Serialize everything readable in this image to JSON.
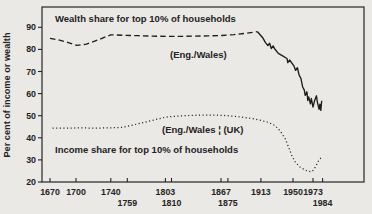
{
  "figure": {
    "background": "#ebe9e6",
    "ink": "#232323"
  },
  "chart_data": {
    "type": "line",
    "title": "",
    "xlabel": "",
    "ylabel": "Per cent of income or wealth",
    "ylim": [
      20,
      99
    ],
    "x_range_years": [
      1670,
      1984
    ],
    "grid": false,
    "legend_position": "inline-annotations",
    "y_ticks": [
      90,
      80,
      70,
      60,
      50,
      40,
      30,
      20
    ],
    "x_ticks": [
      {
        "label": "1670",
        "year": 1670,
        "row": 1
      },
      {
        "label": "1700",
        "year": 1700,
        "row": 1
      },
      {
        "label": "1740",
        "year": 1740,
        "row": 1
      },
      {
        "label": "1759",
        "year": 1759,
        "row": 2
      },
      {
        "label": "1803",
        "year": 1803,
        "row": 1
      },
      {
        "label": "1810",
        "year": 1810,
        "row": 2
      },
      {
        "label": "1867",
        "year": 1867,
        "row": 1
      },
      {
        "label": "1875",
        "year": 1875,
        "row": 2
      },
      {
        "label": "1913",
        "year": 1913,
        "row": 1
      },
      {
        "label": "1950",
        "year": 1950,
        "row": 1
      },
      {
        "label": "1973",
        "year": 1973,
        "row": 1
      },
      {
        "label": "1984",
        "year": 1984,
        "row": 2
      }
    ],
    "labels": {
      "wealth_title": "Wealth share for top 10% of households",
      "wealth_series": "(Eng./Wales)",
      "income_series": "(Eng./Wales ¦ (UK)",
      "income_title": "Income share for top 10% of households"
    },
    "series": [
      {
        "name": "Wealth share for top 10% of households (Eng./Wales, dashed, 1670-1909)",
        "style": "dashed",
        "points": [
          [
            1670,
            85
          ],
          [
            1681,
            84.2
          ],
          [
            1692,
            83
          ],
          [
            1701,
            81.8
          ],
          [
            1712,
            82.4
          ],
          [
            1726,
            84.4
          ],
          [
            1740,
            86.6
          ],
          [
            1756,
            86.4
          ],
          [
            1772,
            86.2
          ],
          [
            1788,
            86.0
          ],
          [
            1804,
            85.9
          ],
          [
            1820,
            85.9
          ],
          [
            1836,
            86.0
          ],
          [
            1852,
            86.1
          ],
          [
            1868,
            86.3
          ],
          [
            1882,
            86.7
          ],
          [
            1896,
            87.3
          ],
          [
            1909,
            88.0
          ]
        ]
      },
      {
        "name": "Wealth share for top 10% of households (solid, 1909-1983)",
        "style": "solid",
        "points": [
          [
            1909,
            88
          ],
          [
            1915,
            85.3
          ],
          [
            1918,
            83.2
          ],
          [
            1921,
            81.7
          ],
          [
            1923,
            82.8
          ],
          [
            1925,
            80.4
          ],
          [
            1927,
            81.6
          ],
          [
            1929,
            80.2
          ],
          [
            1933,
            78.2
          ],
          [
            1938,
            77.1
          ],
          [
            1943,
            75.9
          ],
          [
            1944,
            74.0
          ],
          [
            1946,
            75.2
          ],
          [
            1951,
            72.6
          ],
          [
            1953,
            70.5
          ],
          [
            1955,
            71.7
          ],
          [
            1957,
            68.4
          ],
          [
            1959,
            66.9
          ],
          [
            1961,
            63.1
          ],
          [
            1963,
            61.6
          ],
          [
            1964,
            59.2
          ],
          [
            1966,
            60.8
          ],
          [
            1967,
            56.9
          ],
          [
            1968,
            58.5
          ],
          [
            1970,
            55.4
          ],
          [
            1971,
            57.8
          ],
          [
            1973,
            53.9
          ],
          [
            1975,
            57.0
          ],
          [
            1977,
            59.0
          ],
          [
            1978,
            56.2
          ],
          [
            1980,
            52.9
          ],
          [
            1981,
            55.2
          ],
          [
            1982,
            52.4
          ],
          [
            1983,
            56.8
          ]
        ]
      },
      {
        "name": "Income share for top 10% of households (Eng./Wales then UK, dotted, 1673-1984)",
        "style": "dotted",
        "points": [
          [
            1673,
            44.4
          ],
          [
            1690,
            44.4
          ],
          [
            1706,
            44.5
          ],
          [
            1722,
            44.4
          ],
          [
            1738,
            44.5
          ],
          [
            1752,
            44.7
          ],
          [
            1759,
            45.2
          ],
          [
            1770,
            46.2
          ],
          [
            1781,
            47.2
          ],
          [
            1792,
            48.3
          ],
          [
            1803,
            49.3
          ],
          [
            1816,
            49.8
          ],
          [
            1830,
            50.1
          ],
          [
            1845,
            50.3
          ],
          [
            1860,
            50.3
          ],
          [
            1875,
            50.0
          ],
          [
            1890,
            49.4
          ],
          [
            1902,
            48.8
          ],
          [
            1913,
            47.9
          ],
          [
            1921,
            47.0
          ],
          [
            1929,
            45.6
          ],
          [
            1935,
            43.2
          ],
          [
            1941,
            39.6
          ],
          [
            1945,
            35.6
          ],
          [
            1949,
            31.6
          ],
          [
            1953,
            28.8
          ],
          [
            1958,
            26.8
          ],
          [
            1963,
            25.6
          ],
          [
            1967,
            24.9
          ],
          [
            1971,
            24.6
          ],
          [
            1973,
            25.2
          ],
          [
            1976,
            26.9
          ],
          [
            1979,
            29.3
          ],
          [
            1982,
            30.8
          ],
          [
            1984,
            31.2
          ]
        ]
      }
    ]
  }
}
